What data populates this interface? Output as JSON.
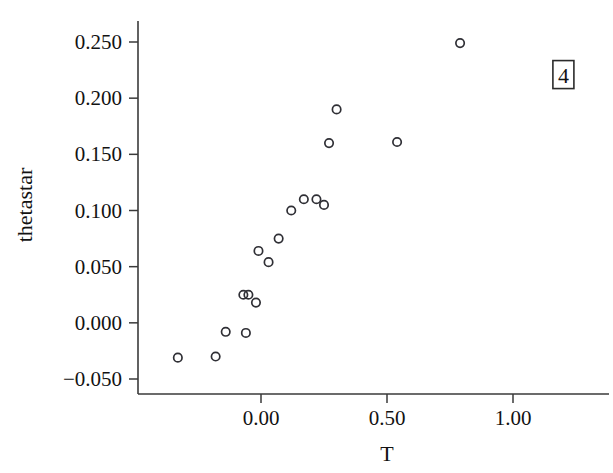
{
  "chart_data": {
    "type": "scatter",
    "title": "",
    "xlabel": "T",
    "ylabel": "thetastar",
    "xlim": [
      -0.42,
      1.3
    ],
    "ylim": [
      -0.072,
      0.272
    ],
    "grid": false,
    "legend": null,
    "xticks": [
      0.0,
      0.5,
      1.0
    ],
    "xticklabels": [
      "0.00",
      "0.50",
      "1.00"
    ],
    "yticks": [
      -0.05,
      0.0,
      0.05,
      0.1,
      0.15,
      0.2,
      0.25
    ],
    "yticklabels": [
      "−0.050",
      "0.000",
      "0.050",
      "0.100",
      "0.150",
      "0.200",
      "0.250"
    ],
    "marker": "open-circle",
    "marker_color": "#2f2f35",
    "points": [
      {
        "x": -0.33,
        "y": -0.031
      },
      {
        "x": -0.18,
        "y": -0.03
      },
      {
        "x": -0.14,
        "y": -0.008
      },
      {
        "x": -0.06,
        "y": -0.009
      },
      {
        "x": -0.07,
        "y": 0.025
      },
      {
        "x": -0.05,
        "y": 0.025
      },
      {
        "x": -0.02,
        "y": 0.018
      },
      {
        "x": -0.01,
        "y": 0.064
      },
      {
        "x": 0.03,
        "y": 0.054
      },
      {
        "x": 0.07,
        "y": 0.075
      },
      {
        "x": 0.12,
        "y": 0.1
      },
      {
        "x": 0.17,
        "y": 0.11
      },
      {
        "x": 0.22,
        "y": 0.11
      },
      {
        "x": 0.25,
        "y": 0.105
      },
      {
        "x": 0.27,
        "y": 0.16
      },
      {
        "x": 0.3,
        "y": 0.19
      },
      {
        "x": 0.54,
        "y": 0.161
      },
      {
        "x": 0.79,
        "y": 0.249
      },
      {
        "x": 1.18,
        "y": 0.214
      }
    ],
    "annotations": [
      {
        "label": "4",
        "x": 1.2,
        "y": 0.221,
        "boxed": true,
        "target_point": {
          "x": 1.18,
          "y": 0.214
        }
      }
    ]
  }
}
